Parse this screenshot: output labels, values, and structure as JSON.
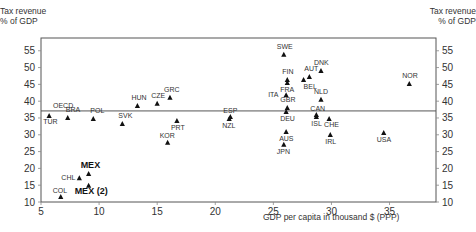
{
  "chart_data": {
    "type": "scatter",
    "title": "",
    "xlabel": "GDP per capita in thousand $ (PPP)",
    "ylabel": "Tax revenue\n% of GDP",
    "ylabel_left": [
      "Tax revenue",
      "% of GDP"
    ],
    "ylabel_right": [
      "Tax revenue",
      "% of GDP"
    ],
    "xlim": [
      5,
      39
    ],
    "ylim": [
      10,
      58.8
    ],
    "x_ticks": [
      5,
      10,
      15,
      20,
      25,
      30,
      35
    ],
    "y_ticks": [
      10,
      15,
      20,
      25,
      30,
      35,
      40,
      45,
      50,
      55
    ],
    "grid": false,
    "marker": "triangle",
    "reference_line": {
      "label": "OECD",
      "y": 37.1
    },
    "points": [
      {
        "label": "TUR",
        "x": 5.7,
        "y": 35.6,
        "lx": -6,
        "ly": 8
      },
      {
        "label": "BRA",
        "x": 7.3,
        "y": 35.0,
        "lx": -2,
        "ly": -6
      },
      {
        "label": "POL",
        "x": 9.5,
        "y": 34.7,
        "lx": -3,
        "ly": -6
      },
      {
        "label": "SVK",
        "x": 12.0,
        "y": 33.2,
        "lx": -4,
        "ly": -6
      },
      {
        "label": "HUN",
        "x": 13.3,
        "y": 38.6,
        "lx": -6,
        "ly": -6
      },
      {
        "label": "CZE",
        "x": 15.0,
        "y": 39.2,
        "lx": -6,
        "ly": -6
      },
      {
        "label": "GRC",
        "x": 16.1,
        "y": 41.0,
        "lx": -6,
        "ly": -6
      },
      {
        "label": "PRT",
        "x": 16.7,
        "y": 34.1,
        "lx": -6,
        "ly": 9
      },
      {
        "label": "KOR",
        "x": 15.9,
        "y": 27.6,
        "lx": -8,
        "ly": -5
      },
      {
        "label": "ESP",
        "x": 21.3,
        "y": 35.3,
        "lx": -7,
        "ly": -4
      },
      {
        "label": "NZL",
        "x": 21.2,
        "y": 34.7,
        "lx": -7,
        "ly": 9
      },
      {
        "label": "CHL",
        "x": 8.3,
        "y": 17.1,
        "lx": -18,
        "ly": 2
      },
      {
        "label": "MEX",
        "x": 9.1,
        "y": 18.3,
        "lx": -8,
        "ly": -6,
        "bold": true
      },
      {
        "label": "MEX (2)",
        "x": 9.1,
        "y": 14.8,
        "lx": -14,
        "ly": 8,
        "bold": true
      },
      {
        "label": "COL",
        "x": 6.7,
        "y": 11.5,
        "lx": -8,
        "ly": -4
      },
      {
        "label": "SWE",
        "x": 25.9,
        "y": 53.8,
        "lx": -7,
        "ly": -6
      },
      {
        "label": "DNK",
        "x": 29.1,
        "y": 49.0,
        "lx": -7,
        "ly": -6
      },
      {
        "label": "FIN",
        "x": 26.2,
        "y": 46.3,
        "lx": -5,
        "ly": -6
      },
      {
        "label": "FRA",
        "x": 26.2,
        "y": 45.4,
        "lx": -7,
        "ly": 9
      },
      {
        "label": "AUT",
        "x": 28.1,
        "y": 47.2,
        "lx": -5,
        "ly": -6
      },
      {
        "label": "BEL",
        "x": 27.6,
        "y": 46.3,
        "lx": 0,
        "ly": 9
      },
      {
        "label": "ITA",
        "x": 26.1,
        "y": 41.8,
        "lx": -18,
        "ly": 2
      },
      {
        "label": "NLD",
        "x": 29.1,
        "y": 40.4,
        "lx": -7,
        "ly": -6
      },
      {
        "label": "GBR",
        "x": 26.2,
        "y": 38.0,
        "lx": -7,
        "ly": -6
      },
      {
        "label": "DEU",
        "x": 26.1,
        "y": 36.8,
        "lx": -6,
        "ly": 9
      },
      {
        "label": "CAN",
        "x": 28.7,
        "y": 35.9,
        "lx": -6,
        "ly": -4
      },
      {
        "label": "ISL",
        "x": 28.7,
        "y": 35.3,
        "lx": -5,
        "ly": 9
      },
      {
        "label": "CHE",
        "x": 29.8,
        "y": 34.7,
        "lx": -5,
        "ly": 8
      },
      {
        "label": "AUS",
        "x": 26.1,
        "y": 30.8,
        "lx": -7,
        "ly": 9
      },
      {
        "label": "JPN",
        "x": 25.9,
        "y": 27.0,
        "lx": -7,
        "ly": 9
      },
      {
        "label": "IRL",
        "x": 29.9,
        "y": 29.9,
        "lx": -5,
        "ly": 9
      },
      {
        "label": "USA",
        "x": 34.5,
        "y": 30.5,
        "lx": -7,
        "ly": 9
      },
      {
        "label": "NOR",
        "x": 36.7,
        "y": 45.1,
        "lx": -7,
        "ly": -6
      }
    ]
  },
  "axes": {
    "left_title_line1": "Tax revenue",
    "left_title_line2": "% of GDP",
    "right_title_line1": "Tax revenue",
    "right_title_line2": "% of GDP",
    "x_title": "GDP per capita in thousand $ (PPP)"
  }
}
